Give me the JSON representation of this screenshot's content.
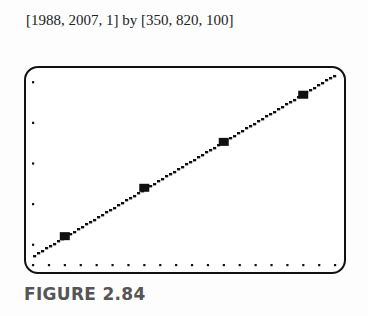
{
  "window_caption": "[1988, 2007, 1] by [350, 820, 100]",
  "figure_label": "FIGURE 2.84",
  "chart_data": {
    "type": "scatter",
    "title": "",
    "xlabel": "",
    "ylabel": "",
    "xlim": [
      1988,
      2007
    ],
    "ylim": [
      350,
      820
    ],
    "xscl": 1,
    "yscl": 100,
    "grid": false,
    "legend": null,
    "series": [
      {
        "name": "data points",
        "type": "scatter",
        "x": [
          1990,
          1995,
          2000,
          2005
        ],
        "y": [
          421,
          540,
          653,
          769
        ]
      },
      {
        "name": "regression line",
        "type": "line",
        "x": [
          1988,
          2007
        ],
        "y": [
          373,
          819
        ]
      }
    ]
  }
}
